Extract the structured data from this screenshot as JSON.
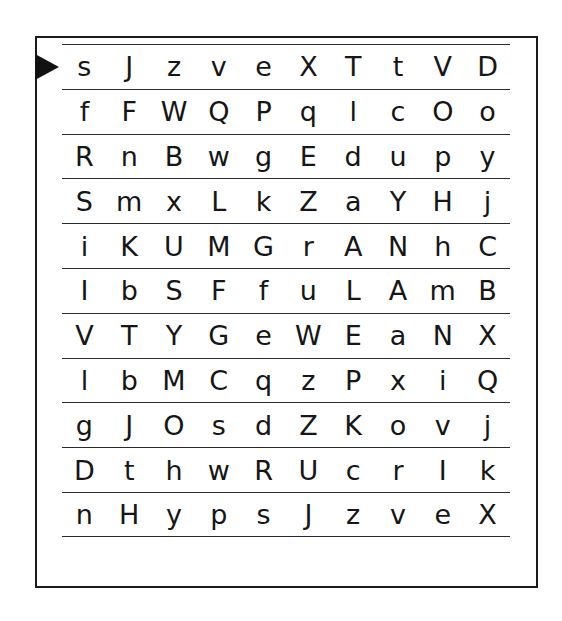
{
  "sheet": {
    "type": "letter-cancellation-grid",
    "row_count": 11,
    "column_count": 10,
    "start_marker_icon": "right-triangle-pointer-icon",
    "start_marker_row_index": 0,
    "frame_color": "#1a1a1a",
    "rule_color": "#2b2b2b",
    "letter_color": "#161616",
    "background_color": "#ffffff",
    "rows": [
      {
        "index": 1,
        "letters": [
          "s",
          "J",
          "z",
          "v",
          "e",
          "X",
          "T",
          "t",
          "V",
          "D"
        ]
      },
      {
        "index": 2,
        "letters": [
          "f",
          "F",
          "W",
          "Q",
          "P",
          "q",
          "l",
          "c",
          "O",
          "o"
        ]
      },
      {
        "index": 3,
        "letters": [
          "R",
          "n",
          "B",
          "w",
          "g",
          "E",
          "d",
          "u",
          "p",
          "y"
        ]
      },
      {
        "index": 4,
        "letters": [
          "S",
          "m",
          "x",
          "L",
          "k",
          "Z",
          "a",
          "Y",
          "H",
          "j"
        ]
      },
      {
        "index": 5,
        "letters": [
          "i",
          "K",
          "U",
          "M",
          "G",
          "r",
          "A",
          "N",
          "h",
          "C"
        ]
      },
      {
        "index": 6,
        "letters": [
          "I",
          "b",
          "S",
          "F",
          "f",
          "u",
          "L",
          "A",
          "m",
          "B"
        ]
      },
      {
        "index": 7,
        "letters": [
          "V",
          "T",
          "Y",
          "G",
          "e",
          "W",
          "E",
          "a",
          "N",
          "X"
        ]
      },
      {
        "index": 8,
        "letters": [
          "l",
          "b",
          "M",
          "C",
          "q",
          "z",
          "P",
          "x",
          "i",
          "Q"
        ]
      },
      {
        "index": 9,
        "letters": [
          "g",
          "J",
          "O",
          "s",
          "d",
          "Z",
          "K",
          "o",
          "v",
          "j"
        ]
      },
      {
        "index": 10,
        "letters": [
          "D",
          "t",
          "h",
          "w",
          "R",
          "U",
          "c",
          "r",
          "I",
          "k"
        ]
      },
      {
        "index": 11,
        "letters": [
          "n",
          "H",
          "y",
          "p",
          "s",
          "J",
          "z",
          "v",
          "e",
          "X"
        ]
      }
    ]
  }
}
